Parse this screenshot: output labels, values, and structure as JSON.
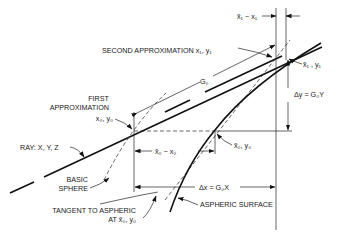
{
  "diagram": {
    "labels": {
      "second_approx": "SECOND APPROXIMATION  x₁, y₁",
      "xtilde1_minus_x1": "x̃₁ − x₁",
      "xtilde1_y1": "x̃₁ , y₁",
      "g0": "G₀",
      "delta_y": "Δy = G₀Y",
      "first_approx_line1": "FIRST",
      "first_approx_line2": "APPROXIMATION",
      "x0_y0": "x₀, y₀",
      "xtilde0_y0": "x̃₀, y₀",
      "xtilde0_minus_x0": "x̃₀ − x₀",
      "ray": "RAY: X, Y, Z",
      "basic_sphere_line1": "BASIC",
      "basic_sphere_line2": "SPHERE",
      "delta_x": "Δx = G₀X",
      "tangent_line1": "TANGENT TO ASPHERIC",
      "tangent_line2": "AT  x̃₀, y₀",
      "aspheric_surface": "ASPHERIC SURFACE"
    }
  }
}
